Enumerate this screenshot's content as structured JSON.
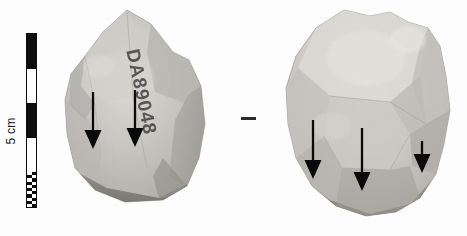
{
  "figure": {
    "caption_absent": true,
    "background_color": "#fdfdfd",
    "width": 467,
    "height": 236
  },
  "scale": {
    "label": "5 cm",
    "units": "cm",
    "total_length_cm": 5,
    "orientation": "vertical",
    "label_rotation_deg": -90,
    "bar_color_dark": "#0d0d0d",
    "bar_color_light": "#ffffff",
    "segments": [
      {
        "type": "black",
        "length_cm": 1
      },
      {
        "type": "white",
        "length_cm": 1
      },
      {
        "type": "black",
        "length_cm": 1
      },
      {
        "type": "white",
        "length_cm": 1
      },
      {
        "type": "checkered-mm",
        "length_cm": 1
      }
    ]
  },
  "specimens": [
    {
      "id": "specimen-left",
      "view_label": "left-view",
      "inscription": "DA89048",
      "inscription_color": "#3c3c3c",
      "body_color": "#b8b6b1",
      "highlight_color": "#d6d4cf",
      "shadow_color": "#8a8884",
      "arrow_count": 2
    },
    {
      "id": "specimen-right",
      "view_label": "right-view",
      "inscription": "",
      "body_color": "#c2c0bb",
      "highlight_color": "#dcdad6",
      "shadow_color": "#949289",
      "arrow_count": 3
    }
  ],
  "annotations": {
    "arrow_color": "#0a0a0a",
    "separator_dash": "—",
    "arrows": [
      {
        "name": "arrow-left-1",
        "specimen": "specimen-left",
        "length_px": 56,
        "size": "long"
      },
      {
        "name": "arrow-left-2",
        "specimen": "specimen-left",
        "length_px": 56,
        "size": "long"
      },
      {
        "name": "arrow-right-1",
        "specimen": "specimen-right",
        "length_px": 58,
        "size": "long"
      },
      {
        "name": "arrow-right-2",
        "specimen": "specimen-right",
        "length_px": 62,
        "size": "long"
      },
      {
        "name": "arrow-right-3",
        "specimen": "specimen-right",
        "length_px": 26,
        "size": "short"
      }
    ]
  }
}
